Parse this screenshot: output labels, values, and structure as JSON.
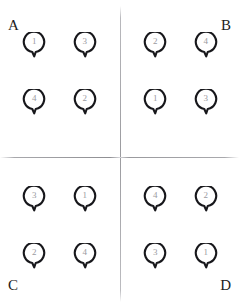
{
  "figure": {
    "top_caption": "",
    "divider_color": "#9b9b9f",
    "ring_stroke_color": "#17171b",
    "ring_number_color": "#9a9aa0",
    "label_color": "#1d1d21"
  },
  "panels": [
    {
      "id": "A",
      "label": "A",
      "position": "top-left",
      "label_corner": "top-left",
      "rings": [
        {
          "number": "1",
          "row": 1,
          "col": 1
        },
        {
          "number": "3",
          "row": 1,
          "col": 2
        },
        {
          "number": "4",
          "row": 2,
          "col": 1
        },
        {
          "number": "2",
          "row": 2,
          "col": 2
        }
      ]
    },
    {
      "id": "B",
      "label": "B",
      "position": "top-right",
      "label_corner": "top-right",
      "rings": [
        {
          "number": "2",
          "row": 1,
          "col": 1
        },
        {
          "number": "4",
          "row": 1,
          "col": 2
        },
        {
          "number": "1",
          "row": 2,
          "col": 1
        },
        {
          "number": "3",
          "row": 2,
          "col": 2
        }
      ]
    },
    {
      "id": "C",
      "label": "C",
      "position": "bottom-left",
      "label_corner": "bottom-left",
      "rings": [
        {
          "number": "3",
          "row": 1,
          "col": 1
        },
        {
          "number": "1",
          "row": 1,
          "col": 2
        },
        {
          "number": "2",
          "row": 2,
          "col": 1
        },
        {
          "number": "4",
          "row": 2,
          "col": 2
        }
      ]
    },
    {
      "id": "D",
      "label": "D",
      "position": "bottom-right",
      "label_corner": "bottom-right",
      "rings": [
        {
          "number": "4",
          "row": 1,
          "col": 1
        },
        {
          "number": "2",
          "row": 1,
          "col": 2
        },
        {
          "number": "3",
          "row": 2,
          "col": 1
        },
        {
          "number": "1",
          "row": 2,
          "col": 2
        }
      ]
    }
  ]
}
